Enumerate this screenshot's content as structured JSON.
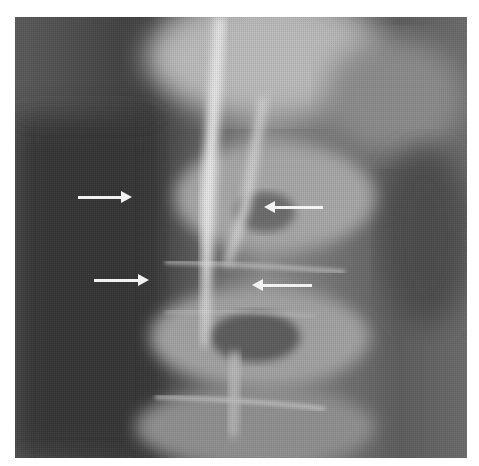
{
  "image": {
    "type": "radiograph",
    "description": "Grayscale X-ray of spine with four white arrows",
    "frame": {
      "x": 15,
      "y": 17,
      "width": 452,
      "height": 441
    },
    "colors": {
      "background": "#ffffff",
      "dark_soft_tissue": "#3a3a3a",
      "mid_gray": "#6e6e6e",
      "bone_bright": "#d8d8d8",
      "arrow": "#f2f2f2"
    }
  },
  "arrows": [
    {
      "id": 1,
      "direction": "right",
      "x1": 78,
      "x2": 132,
      "y": 197
    },
    {
      "id": 2,
      "direction": "left",
      "x1": 264,
      "x2": 323,
      "y": 207
    },
    {
      "id": 3,
      "direction": "right",
      "x1": 94,
      "x2": 149,
      "y": 280
    },
    {
      "id": 4,
      "direction": "left",
      "x1": 252,
      "x2": 312,
      "y": 285
    }
  ]
}
